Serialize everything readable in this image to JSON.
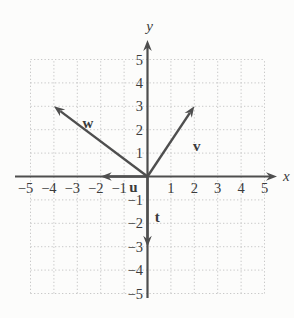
{
  "figure": {
    "background": "#fcfcfb",
    "colors": {
      "axis": "#4e4e4e",
      "vector": "#4e4e4e",
      "grid": "#c8c8c8",
      "text": "#3b3b3b"
    }
  },
  "chart_data": {
    "type": "line",
    "subtype": "vector-diagram",
    "title": "",
    "xlabel": "x",
    "ylabel": "y",
    "xlim": [
      -5,
      5
    ],
    "ylim": [
      -5,
      5
    ],
    "grid": true,
    "grid_style": "dotted",
    "x_ticks": [
      -5,
      -4,
      -3,
      -2,
      -1,
      1,
      2,
      3,
      4,
      5
    ],
    "y_ticks": [
      5,
      4,
      3,
      2,
      1,
      -1,
      -2,
      -3,
      -4,
      -5
    ],
    "vectors": [
      {
        "name": "w",
        "from": [
          0,
          0
        ],
        "to": [
          -4,
          3
        ],
        "label": "w",
        "label_at": [
          -2.55,
          2.3
        ]
      },
      {
        "name": "v",
        "from": [
          0,
          0
        ],
        "to": [
          2,
          3
        ],
        "label": "v",
        "label_at": [
          2.1,
          1.32
        ]
      },
      {
        "name": "u",
        "from": [
          0,
          0
        ],
        "to": [
          -2,
          0
        ],
        "label": "u",
        "label_at": [
          -0.6,
          -0.45
        ]
      },
      {
        "name": "t",
        "from": [
          0,
          0
        ],
        "to": [
          0,
          -3
        ],
        "label": "t",
        "label_at": [
          0.42,
          -1.72
        ]
      }
    ]
  }
}
